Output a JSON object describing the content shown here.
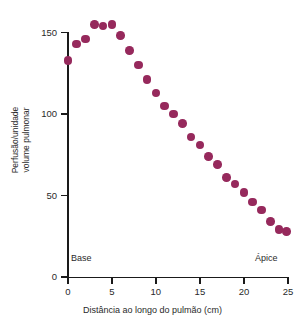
{
  "chart_data": {
    "type": "scatter",
    "title": "",
    "xlabel": "Distância ao longo do pulmão (cm)",
    "ylabel": "Perfusão/unidade volume pulmonar",
    "ylabel_lines": [
      "Perfusão/unidade",
      "volume pulmonar"
    ],
    "xlim": [
      -1.5,
      25.5
    ],
    "ylim": [
      0,
      163
    ],
    "xticks": [
      0,
      5,
      10,
      15,
      20,
      25
    ],
    "xticklabels": [
      "0",
      "5",
      "10",
      "15",
      "20",
      "25"
    ],
    "yticks": [
      0,
      50,
      100,
      150
    ],
    "yticklabels": [
      "0",
      "50",
      "100",
      "150"
    ],
    "grid": false,
    "legend": null,
    "marker_color": "#96295c",
    "marker": "circle",
    "axis_color": "#1a1a1a",
    "annotations": [
      {
        "text": "Base",
        "x": 0.3,
        "y": 14,
        "align": "left"
      },
      {
        "text": "Ápice",
        "x": 21.5,
        "y": 14,
        "align": "left"
      }
    ],
    "x": [
      0,
      1,
      2,
      3,
      4,
      5,
      6,
      7,
      8,
      9,
      10,
      11,
      12,
      13,
      14,
      15,
      16,
      17,
      18,
      19,
      20,
      21,
      22,
      23,
      24,
      24.8
    ],
    "y": [
      133,
      143,
      146,
      155,
      154,
      155,
      148,
      139,
      130,
      121,
      113,
      105,
      100,
      94,
      86,
      81,
      74,
      69,
      61,
      57,
      52,
      46,
      41,
      34,
      29,
      28
    ],
    "series": [
      {
        "name": "Perfusão",
        "color": "#96295c",
        "points": [
          {
            "x": 0,
            "y": 133
          },
          {
            "x": 1,
            "y": 143
          },
          {
            "x": 2,
            "y": 146
          },
          {
            "x": 3,
            "y": 155
          },
          {
            "x": 4,
            "y": 154
          },
          {
            "x": 5,
            "y": 155
          },
          {
            "x": 6,
            "y": 148
          },
          {
            "x": 7,
            "y": 139
          },
          {
            "x": 8,
            "y": 130
          },
          {
            "x": 9,
            "y": 121
          },
          {
            "x": 10,
            "y": 113
          },
          {
            "x": 11,
            "y": 105
          },
          {
            "x": 12,
            "y": 100
          },
          {
            "x": 13,
            "y": 94
          },
          {
            "x": 14,
            "y": 86
          },
          {
            "x": 15,
            "y": 81
          },
          {
            "x": 16,
            "y": 74
          },
          {
            "x": 17,
            "y": 69
          },
          {
            "x": 18,
            "y": 61
          },
          {
            "x": 19,
            "y": 57
          },
          {
            "x": 20,
            "y": 52
          },
          {
            "x": 21,
            "y": 46
          },
          {
            "x": 22,
            "y": 41
          },
          {
            "x": 23,
            "y": 34
          },
          {
            "x": 24,
            "y": 29
          },
          {
            "x": 24.8,
            "y": 28
          }
        ]
      }
    ]
  }
}
